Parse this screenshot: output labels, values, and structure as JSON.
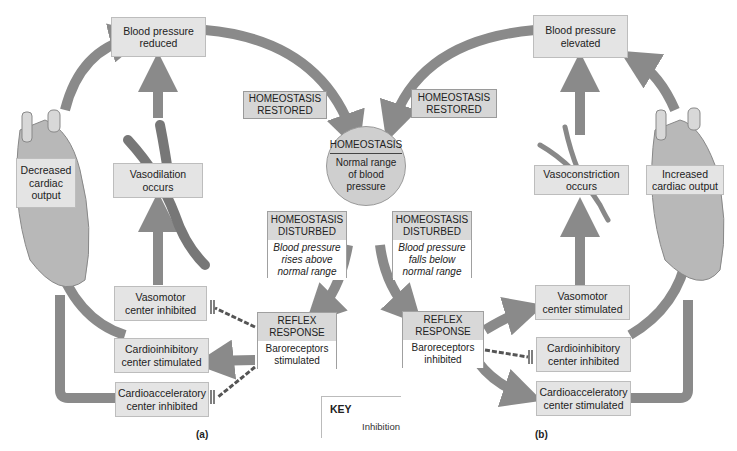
{
  "diagram": {
    "type": "homeostasis feedback loop",
    "colors": {
      "arrow": "#8a8a8a",
      "box_fill": "#e4e4e4",
      "header_fill": "#d6d6d6",
      "circle_fill": "#cfcfcf",
      "inhibition_line": "#555555"
    },
    "center": {
      "title": "HOMEOSTASIS",
      "body": [
        "Normal range",
        "of blood",
        "pressure"
      ]
    },
    "restored_left": [
      "HOMEOSTASIS",
      "RESTORED"
    ],
    "restored_right": [
      "HOMEOSTASIS",
      "RESTORED"
    ],
    "panel_a": {
      "label": "(a)",
      "top_box": [
        "Blood pressure",
        "reduced"
      ],
      "heart_label": [
        "Decreased",
        "cardiac",
        "output"
      ],
      "vessel_label": [
        "Vasodilation",
        "occurs"
      ],
      "disturbed": {
        "title": [
          "HOMEOSTASIS",
          "DISTURBED"
        ],
        "body": [
          "Blood pressure",
          "rises above",
          "normal range"
        ]
      },
      "reflex": {
        "title": [
          "REFLEX",
          "RESPONSE"
        ],
        "body": [
          "Baroreceptors",
          "stimulated"
        ]
      },
      "vasomotor": [
        "Vasomotor",
        "center inhibited"
      ],
      "cardioinhibitory": [
        "Cardioinhibitory",
        "center stimulated"
      ],
      "cardioaccelerator": [
        "Cardioacceleratory",
        "center inhibited"
      ]
    },
    "panel_b": {
      "label": "(b)",
      "top_box": [
        "Blood pressure",
        "elevated"
      ],
      "heart_label": [
        "Increased",
        "cardiac output"
      ],
      "vessel_label": [
        "Vasoconstriction",
        "occurs"
      ],
      "disturbed": {
        "title": [
          "HOMEOSTASIS",
          "DISTURBED"
        ],
        "body": [
          "Blood pressure",
          "falls below",
          "normal range"
        ]
      },
      "reflex": {
        "title": [
          "REFLEX",
          "RESPONSE"
        ],
        "body": [
          "Baroreceptors",
          "inhibited"
        ]
      },
      "vasomotor": [
        "Vasomotor",
        "center stimulated"
      ],
      "cardioinhibitory": [
        "Cardioinhibitory",
        "center inhibited"
      ],
      "cardioaccelerator": [
        "Cardioacceleratory",
        "center stimulated"
      ]
    },
    "key": {
      "title": "KEY",
      "inhibition_label": "Inhibition"
    }
  }
}
